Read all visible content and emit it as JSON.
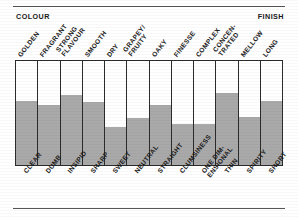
{
  "figure": {
    "caption_left": "COLOUR",
    "caption_right": "FINISH",
    "fill_color": "#a9a9a9",
    "frame_color": "#2b2b2b"
  },
  "chart_data": {
    "type": "bar",
    "title": "",
    "subtitle": "",
    "xlabel": "",
    "ylabel": "",
    "ylim": [
      0,
      100
    ],
    "grid": false,
    "legend": "none",
    "axis_note_left": "COLOUR",
    "axis_note_right": "FINISH",
    "positive_labels": [
      "GOLDEN",
      "FRAGRANT",
      "STRONG\nFLAVOUR",
      "SMOOTH",
      "DRY",
      "GRAPEY/\nFRUITY",
      "OAKY",
      "FINESSE",
      "COMPLEX",
      "CONCEN-\nTRATED",
      "MELLOW",
      "LONG"
    ],
    "negative_labels": [
      "CLEAR",
      "DUMB",
      "INSIPID",
      "SHARP",
      "SWEET",
      "NEUTRAL",
      "STRAIGHT",
      "CLUMSINESS",
      "ONE DIM-\nENSIONAL",
      "THIN",
      "SPIRITY",
      "SHORT"
    ],
    "categories": [
      "GOLDEN / CLEAR",
      "FRAGRANT / DUMB",
      "STRONG FLAVOUR / INSIPID",
      "SMOOTH / SHARP",
      "DRY / SWEET",
      "GRAPEY-FRUITY / NEUTRAL",
      "OAKY / STRAIGHT",
      "FINESSE / CLUMSINESS",
      "COMPLEX / ONE DIMENSIONAL",
      "CONCENTRATED / THIN",
      "MELLOW / SPIRITY",
      "LONG / SHORT"
    ],
    "values": [
      62,
      58,
      67,
      61,
      37,
      45,
      58,
      39,
      39,
      69,
      46,
      62
    ],
    "bars": [
      {
        "label": "GOLDEN",
        "counter_label": "CLEAR",
        "value": 62
      },
      {
        "label": "FRAGRANT",
        "counter_label": "DUMB",
        "value": 58
      },
      {
        "label": "STRONG FLAVOUR",
        "counter_label": "INSIPID",
        "value": 67
      },
      {
        "label": "SMOOTH",
        "counter_label": "SHARP",
        "value": 61
      },
      {
        "label": "DRY",
        "counter_label": "SWEET",
        "value": 37
      },
      {
        "label": "NEUTRAL",
        "counter_label": "NEUTRAL",
        "value": 45
      },
      {
        "label": "GRAPEY/FRUITY",
        "counter_label": "STRAIGHT",
        "value": 58
      },
      {
        "label": "OAKY",
        "counter_label": "CLUMSINESS",
        "value": 39
      },
      {
        "label": "FINESSE",
        "counter_label": "ONE DIMENSIONAL",
        "value": 39
      },
      {
        "label": "COMPLEX",
        "counter_label": "THIN",
        "value": 69
      },
      {
        "label": "CONCENTRATED",
        "counter_label": "SPIRITY",
        "value": 46
      },
      {
        "label": "MELLOW",
        "counter_label": "SHORT",
        "value": 62
      }
    ]
  }
}
